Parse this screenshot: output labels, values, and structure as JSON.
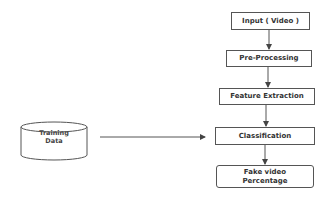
{
  "diagram": {
    "nodes": [
      {
        "id": "input",
        "label": "Input ( Video )"
      },
      {
        "id": "preprocessing",
        "label": "Pre-Processing"
      },
      {
        "id": "feature_extraction",
        "label": "Feature Extraction"
      },
      {
        "id": "classification",
        "label": "Classification"
      },
      {
        "id": "output",
        "label_line1": "Fake video",
        "label_line2": "Percentage"
      }
    ],
    "datastore": {
      "id": "training_data",
      "label_line1": "Training",
      "label_line2": "Data"
    },
    "edges": [
      {
        "from": "input",
        "to": "preprocessing"
      },
      {
        "from": "preprocessing",
        "to": "feature_extraction"
      },
      {
        "from": "feature_extraction",
        "to": "classification"
      },
      {
        "from": "classification",
        "to": "output"
      },
      {
        "from": "training_data",
        "to": "classification"
      }
    ],
    "colors": {
      "stroke": "#555555",
      "text": "#333333",
      "background": "#ffffff"
    }
  }
}
